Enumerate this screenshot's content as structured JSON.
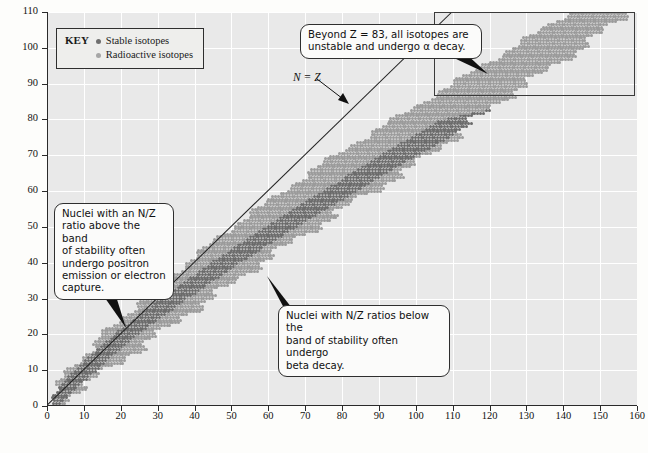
{
  "chart_data": {
    "type": "scatter",
    "xlabel": "Neutron number (N)",
    "ylabel": "Atomic number (Z)",
    "xlim": [
      0,
      160
    ],
    "ylim": [
      0,
      110
    ],
    "xticks": [
      0,
      10,
      20,
      30,
      40,
      50,
      60,
      70,
      80,
      90,
      100,
      110,
      120,
      130,
      140,
      150,
      160
    ],
    "yticks": [
      0,
      10,
      20,
      30,
      40,
      50,
      60,
      70,
      80,
      90,
      100,
      110
    ],
    "grid": true,
    "legend_position": "top-left",
    "series": [
      {
        "name": "Stable isotopes",
        "marker": "dot",
        "color": "#6a6a6a"
      },
      {
        "name": "Radioactive isotopes",
        "marker": "dot",
        "color": "#9a9a9a"
      }
    ],
    "reference_line": {
      "label": "N = Z",
      "slope": 1,
      "intercept": 0
    },
    "band_description": "Nuclide band rising from (0,0) to about (157,110); N/Z ratio increases from 1 at low Z to roughly 1.5 at high Z.",
    "band_points": [
      {
        "z": 0,
        "n_min": 0,
        "n_max": 2
      },
      {
        "z": 5,
        "n_min": 2,
        "n_max": 9
      },
      {
        "z": 10,
        "n_min": 6,
        "n_max": 16
      },
      {
        "z": 15,
        "n_min": 11,
        "n_max": 23
      },
      {
        "z": 20,
        "n_min": 15,
        "n_max": 30
      },
      {
        "z": 25,
        "n_min": 21,
        "n_max": 37
      },
      {
        "z": 30,
        "n_min": 26,
        "n_max": 44
      },
      {
        "z": 35,
        "n_min": 32,
        "n_max": 51
      },
      {
        "z": 40,
        "n_min": 38,
        "n_max": 58
      },
      {
        "z": 45,
        "n_min": 44,
        "n_max": 65
      },
      {
        "z": 50,
        "n_min": 50,
        "n_max": 73
      },
      {
        "z": 55,
        "n_min": 57,
        "n_max": 80
      },
      {
        "z": 60,
        "n_min": 64,
        "n_max": 88
      },
      {
        "z": 65,
        "n_min": 71,
        "n_max": 96
      },
      {
        "z": 70,
        "n_min": 78,
        "n_max": 103
      },
      {
        "z": 75,
        "n_min": 86,
        "n_max": 110
      },
      {
        "z": 80,
        "n_min": 94,
        "n_max": 116
      },
      {
        "z": 85,
        "n_min": 102,
        "n_max": 122
      },
      {
        "z": 90,
        "n_min": 110,
        "n_max": 130
      },
      {
        "z": 95,
        "n_min": 118,
        "n_max": 137
      },
      {
        "z": 100,
        "n_min": 126,
        "n_max": 145
      },
      {
        "z": 105,
        "n_min": 134,
        "n_max": 151
      },
      {
        "z": 110,
        "n_min": 142,
        "n_max": 157
      }
    ],
    "stable_line": [
      {
        "z": 0,
        "n": 0
      },
      {
        "z": 10,
        "n": 10
      },
      {
        "z": 20,
        "n": 21
      },
      {
        "z": 30,
        "n": 34
      },
      {
        "z": 40,
        "n": 48
      },
      {
        "z": 50,
        "n": 63
      },
      {
        "z": 60,
        "n": 79
      },
      {
        "z": 70,
        "n": 95
      },
      {
        "z": 80,
        "n": 112
      },
      {
        "z": 83,
        "n": 126
      }
    ],
    "annotations": [
      "Beyond Z = 83, all isotopes are unstable and undergo α decay.",
      "Nuclei with an N/Z ratio above the band of stability often undergo positron emission or electron capture.",
      "Nuclei with N/Z ratios below the band of stability often undergo beta decay.",
      "N = Z"
    ]
  },
  "axes": {
    "x_title": "Neutron number (N)",
    "y_title": "Atomic number (Z)",
    "x_ticks": [
      "0",
      "10",
      "20",
      "30",
      "40",
      "50",
      "60",
      "70",
      "80",
      "90",
      "100",
      "110",
      "120",
      "130",
      "140",
      "150",
      "160"
    ],
    "y_ticks": [
      "0",
      "10",
      "20",
      "30",
      "40",
      "50",
      "60",
      "70",
      "80",
      "90",
      "100",
      "110"
    ]
  },
  "legend": {
    "title": "KEY",
    "items": [
      {
        "marker_color": "#6f6f6f",
        "equals": "=",
        "label": "Stable isotopes"
      },
      {
        "marker_color": "#a6a6a6",
        "equals": "=",
        "label": "Radioactive isotopes"
      }
    ]
  },
  "callouts": {
    "alpha_decay": {
      "line1": "Beyond Z = 83, all isotopes are",
      "line2": "unstable and undergo α decay."
    },
    "positron": {
      "line1": "Nuclei with an N/Z",
      "line2": "ratio above the band",
      "line3": "of stability often",
      "line4": "undergo positron",
      "line5": "emission or electron",
      "line6": "capture."
    },
    "beta": {
      "line1": "Nuclei with N/Z ratios below the",
      "line2": "band of stability often undergo",
      "line3": "beta decay."
    }
  },
  "reference_label": {
    "text": "N = Z"
  },
  "colors": {
    "plot_background": "#e9e9e9",
    "gridline": "#ffffff",
    "axis": "#2a2a2a",
    "stable_marker": "#6a6a6a",
    "radioactive_marker": "#9a9a9a",
    "callout_background": "#fbfbfa",
    "callout_border": "#2e2e2e"
  }
}
